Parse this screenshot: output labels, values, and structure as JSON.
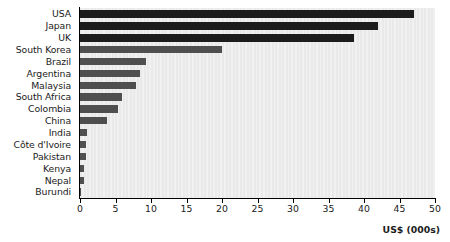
{
  "chart_data": {
    "type": "bar",
    "orientation": "horizontal",
    "title": "",
    "subtitle": "",
    "xlabel": "US$ (000s)",
    "ylabel": "",
    "xlim": [
      0,
      50
    ],
    "xticks": [
      0,
      5,
      10,
      15,
      20,
      25,
      30,
      35,
      40,
      45,
      50
    ],
    "xtick_labels": [
      "0",
      "5",
      "10",
      "15",
      "20",
      "25",
      "30",
      "35",
      "40",
      "45",
      "50"
    ],
    "grid": false,
    "legend": null,
    "categories": [
      "USA",
      "Japan",
      "UK",
      "South Korea",
      "Brazil",
      "Argentina",
      "Malaysia",
      "South Africa",
      "Colombia",
      "China",
      "India",
      "Côte d'Ivoire",
      "Pakistan",
      "Kenya",
      "Nepal",
      "Burundi"
    ],
    "values": [
      47.0,
      42.0,
      38.6,
      20.0,
      9.3,
      8.4,
      7.9,
      5.9,
      5.4,
      3.8,
      1.0,
      0.9,
      0.9,
      0.6,
      0.5,
      0.15
    ],
    "bar_colors": [
      "#1c1c1c",
      "#1c1c1c",
      "#1c1c1c",
      "#4f4f4f",
      "#4f4f4f",
      "#4f4f4f",
      "#4f4f4f",
      "#4f4f4f",
      "#4f4f4f",
      "#4f4f4f",
      "#4f4f4f",
      "#4f4f4f",
      "#4f4f4f",
      "#4f4f4f",
      "#4f4f4f",
      "#4f4f4f"
    ],
    "plot_background": "#e9e9e9",
    "axis_color": "#000000"
  }
}
